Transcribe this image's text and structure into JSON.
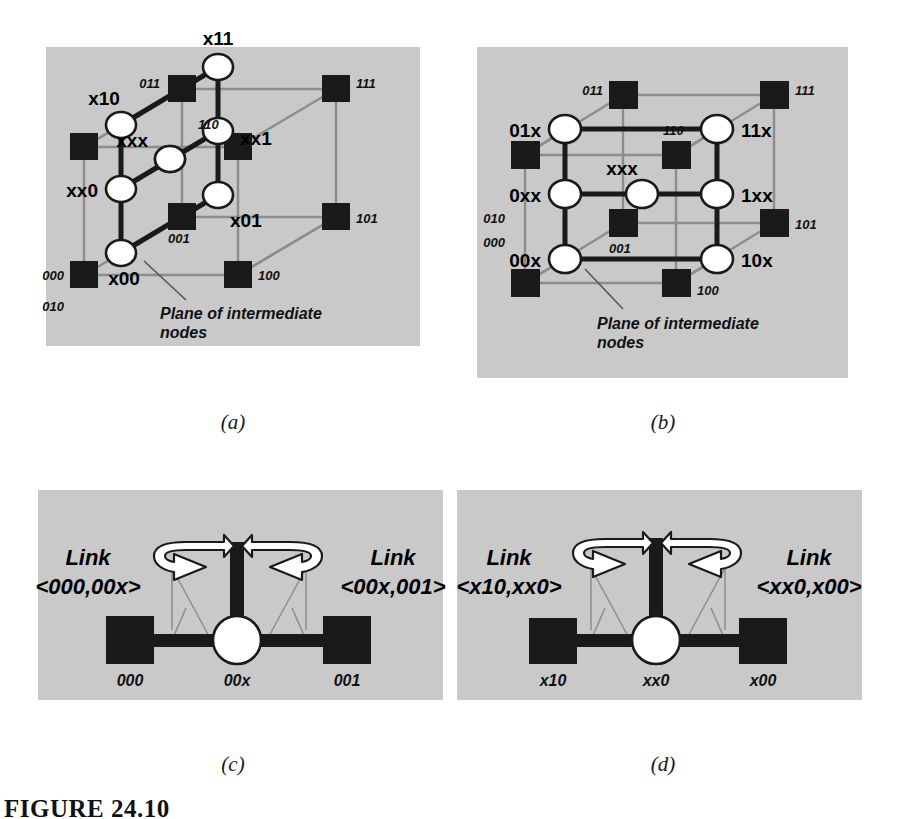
{
  "figure": {
    "caption": "FIGURE 24.10",
    "background": "#ffffff",
    "panel_background": "#c9c9c9",
    "node_fill": "#ffffff",
    "terminal_fill": "#1a1a1a",
    "thick_edge_color": "#1a1a1a",
    "thin_edge_color": "#8d8d8d"
  },
  "panels": [
    {
      "id": "a",
      "caption": "(a)",
      "plane_note": [
        "Plane of intermediate",
        "nodes"
      ],
      "intermediate_nodes": [
        {
          "label": "x11",
          "label_pos": "above"
        },
        {
          "label": "x10",
          "label_pos": "left"
        },
        {
          "label": "xx1",
          "label_pos": "right"
        },
        {
          "label": "xxx",
          "label_pos": "left"
        },
        {
          "label": "xx0",
          "label_pos": "left"
        },
        {
          "label": "x01",
          "label_pos": "right"
        },
        {
          "label": "x00",
          "label_pos": "below"
        }
      ],
      "terminal_nodes": [
        "011",
        "111",
        "110",
        "101",
        "001",
        "000",
        "010",
        "100"
      ]
    },
    {
      "id": "b",
      "caption": "(b)",
      "plane_note": [
        "Plane of intermediate",
        "nodes"
      ],
      "intermediate_nodes": [
        {
          "label": "01x",
          "label_pos": "left"
        },
        {
          "label": "11x",
          "label_pos": "right"
        },
        {
          "label": "0xx",
          "label_pos": "left"
        },
        {
          "label": "xxx",
          "label_pos": "above"
        },
        {
          "label": "1xx",
          "label_pos": "right"
        },
        {
          "label": "00x",
          "label_pos": "left"
        },
        {
          "label": "10x",
          "label_pos": "right"
        }
      ],
      "terminal_nodes": [
        "011",
        "111",
        "110",
        "010",
        "000",
        "001",
        "101",
        "100"
      ]
    },
    {
      "id": "c",
      "caption": "(c)",
      "left_link_title": "Link",
      "left_link_name": "<000,00x>",
      "right_link_title": "Link",
      "right_link_name": "<00x,001>",
      "left_node": "000",
      "center_node": "00x",
      "right_node": "001"
    },
    {
      "id": "d",
      "caption": "(d)",
      "left_link_title": "Link",
      "left_link_name": "<x10,xx0>",
      "right_link_title": "Link",
      "right_link_name": "<xx0,x00>",
      "left_node": "x10",
      "center_node": "xx0",
      "right_node": "x00"
    }
  ]
}
